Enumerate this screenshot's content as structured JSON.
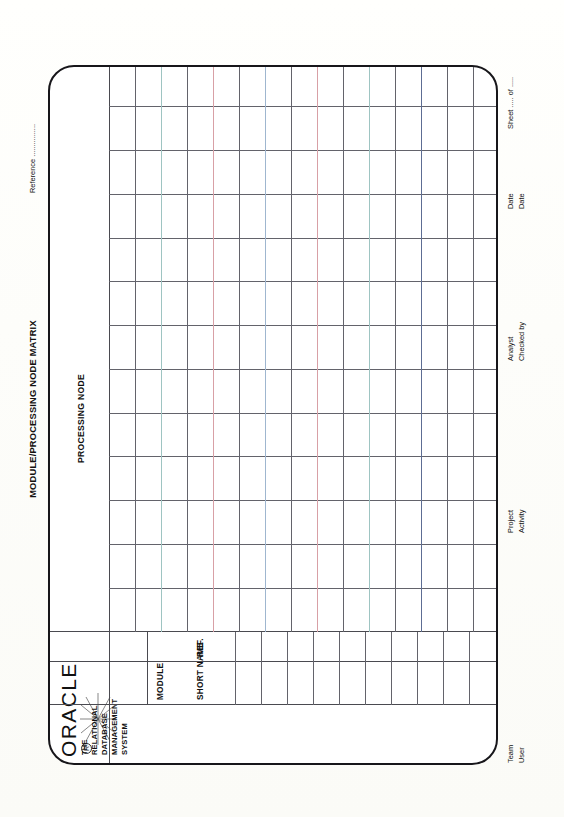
{
  "document": {
    "title": "MODULE/PROCESSING NODE MATRIX",
    "reference_label": "Reference ................",
    "sheet_label": "Sheet ..... of ....."
  },
  "brand": {
    "name": "ORACLE",
    "registered_mark": "R",
    "tagline_line1": "THE RELATIONAL DATABASE",
    "tagline_line2": "MANAGEMENT SYSTEM"
  },
  "table": {
    "left_headers": {
      "module": "MODULE",
      "short_name": "SHORT NAME",
      "ref": "REF."
    },
    "column_header": "PROCESSING NODE",
    "row_count": 15,
    "column_count": 13
  },
  "footer": {
    "fields": [
      {
        "label_1": "Team",
        "label_2": "User"
      },
      {
        "label_1": "Project",
        "label_2": "Activity"
      },
      {
        "label_1": "Analyst",
        "label_2": "Checked by"
      },
      {
        "label_1": "Date",
        "label_2": "Date"
      }
    ]
  },
  "colors": {
    "ink": "#17161a",
    "rule": "#63636b",
    "paper": "#fdfdfb",
    "tint_red": "#d8a0a6",
    "tint_blue": "#9fb6cf",
    "tint_teal": "#9ec4c2",
    "tint_navy": "#5d6d93"
  }
}
